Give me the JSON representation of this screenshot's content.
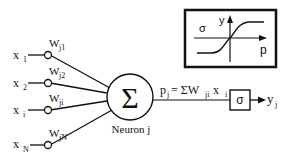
{
  "diagram": {
    "inputs": [
      {
        "label": "x",
        "sub": "1",
        "weight": "W",
        "weight_sub": "j1"
      },
      {
        "label": "x",
        "sub": "2",
        "weight": "W",
        "weight_sub": "j2"
      },
      {
        "label": "x",
        "sub": "i",
        "weight": "W",
        "weight_sub": "ji"
      },
      {
        "label": "x",
        "sub": "N",
        "weight": "W",
        "weight_sub": "jN"
      }
    ],
    "neuron": {
      "symbol": "Σ",
      "label": "Neuron j"
    },
    "sum_expr": {
      "p": "p",
      "p_sub": "j",
      "eq": "= ΣW",
      "w_sub": "ji",
      "x": " x",
      "x_sub": "i"
    },
    "activation": {
      "symbol": "σ"
    },
    "output": {
      "label": "y",
      "sub": "j"
    },
    "inset": {
      "sigma": "σ",
      "y_axis": "y",
      "x_axis": "p"
    }
  }
}
